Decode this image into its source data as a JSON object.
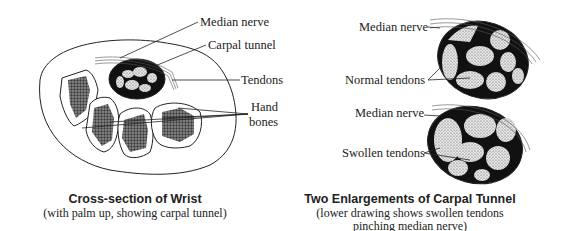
{
  "left_figure": {
    "labels": {
      "median_nerve": "Median nerve",
      "carpal_tunnel": "Carpal tunnel",
      "tendons": "Tendons",
      "hand_bones_line1": "Hand",
      "hand_bones_line2": "bones"
    },
    "caption": {
      "title": "Cross-section of Wrist",
      "subtitle": "(with palm up, showing carpal tunnel)"
    }
  },
  "right_figure": {
    "upper": {
      "median_nerve": "Median nerve",
      "tendons": "Normal tendons"
    },
    "lower": {
      "median_nerve": "Median nerve",
      "tendons": "Swollen tendons"
    },
    "caption": {
      "title": "Two Enlargements of Carpal Tunnel",
      "subtitle_line1": "(lower drawing shows swollen tendons",
      "subtitle_line2": "pinching median nerve)"
    }
  }
}
